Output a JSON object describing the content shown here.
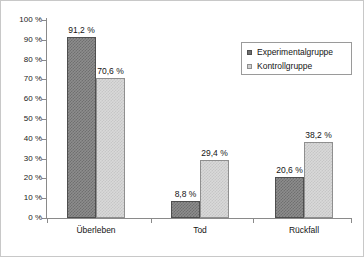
{
  "chart_data": {
    "type": "bar",
    "title": "",
    "subtitle": "",
    "xlabel": "",
    "ylabel": "",
    "categories": [
      "Überleben",
      "Tod",
      "Rückfall"
    ],
    "series": [
      {
        "name": "Experimentalgruppe",
        "color": "#6f6f6f",
        "values": [
          91.2,
          8.8,
          20.6
        ],
        "labels": [
          "91,2 %",
          "8,8 %",
          "20,6 %"
        ]
      },
      {
        "name": "Kontrollgruppe",
        "color": "#cfcfcf",
        "values": [
          70.6,
          29.4,
          38.2
        ],
        "labels": [
          "70,6 %",
          "29,4 %",
          "38,2 %"
        ]
      }
    ],
    "ylim": [
      0,
      100
    ],
    "ytick_values": [
      0,
      10,
      20,
      30,
      40,
      50,
      60,
      70,
      80,
      90,
      100
    ],
    "ytick_labels": [
      "0 %",
      "10 %",
      "20 %",
      "30 %",
      "40 %",
      "50 %",
      "60 %",
      "70 %",
      "80 %",
      "90 %",
      "100 %"
    ],
    "grid": false,
    "legend_position": "top-right",
    "value_labels_shown": true,
    "axis_color": "#8a8a8a",
    "text_color": "#141414",
    "background_color": "#ffffff",
    "border_color": "#c8c8c8"
  },
  "legend": {
    "entries": [
      {
        "label": "Experimentalgruppe",
        "swatch": "dark-square-swatch"
      },
      {
        "label": "Kontrollgruppe",
        "swatch": "light-square-swatch"
      }
    ]
  }
}
